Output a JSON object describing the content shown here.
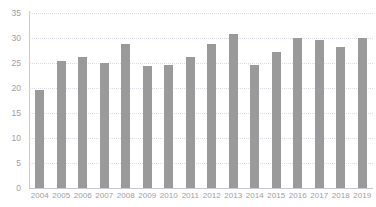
{
  "chart_data": {
    "type": "bar",
    "title": "",
    "subtitle": "",
    "xlabel": "",
    "ylabel": "",
    "categories": [
      "2004",
      "2005",
      "2006",
      "2007",
      "2008",
      "2009",
      "2010",
      "2011",
      "2012",
      "2013",
      "2014",
      "2015",
      "2016",
      "2017",
      "2018",
      "2019"
    ],
    "values": [
      19.6,
      25.4,
      26.2,
      25.0,
      28.8,
      24.4,
      24.7,
      26.2,
      28.8,
      30.8,
      24.6,
      27.2,
      30.0,
      29.7,
      28.2,
      30.1
    ],
    "series": [
      {
        "name": "",
        "values": [
          19.6,
          25.4,
          26.2,
          25.0,
          28.8,
          24.4,
          24.7,
          26.2,
          28.8,
          30.8,
          24.6,
          27.2,
          30.0,
          29.7,
          28.2,
          30.1
        ]
      }
    ],
    "ylim": [
      0,
      35
    ],
    "yticks": [
      0,
      5,
      10,
      15,
      20,
      25,
      30,
      35
    ],
    "ytick_labels": [
      "0",
      "5",
      "10",
      "15",
      "20",
      "25",
      "30",
      "35"
    ],
    "xtick_labels": [
      "2004",
      "2005",
      "2006",
      "2007",
      "2008",
      "2009",
      "2010",
      "2011",
      "2012",
      "2013",
      "2014",
      "2015",
      "2016",
      "2017",
      "2018",
      "2019"
    ],
    "grid": true,
    "grid_axis": "y",
    "legend": false,
    "legend_position": "none",
    "annotations": [],
    "bar_color": "#9a9a9a",
    "grid_color": "#dcdce4",
    "axis_color": "#c9c9d2",
    "tick_label_color": "#9d9da6",
    "background_color": "#ffffff"
  }
}
